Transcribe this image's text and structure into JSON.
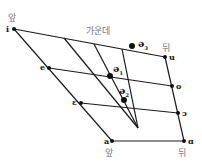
{
  "diagram": {
    "type": "vowel-quadrilateral",
    "labels": {
      "front_top": "앞",
      "back_top": "뒤",
      "central": "가운데",
      "front_bottom": "앞",
      "back_bottom": "뒤"
    },
    "vertices": {
      "i": {
        "label": "i",
        "x": 14,
        "y": 29
      },
      "e": {
        "label": "e",
        "x": 49,
        "y": 68
      },
      "epsilon": {
        "label": "ɛ",
        "x": 81,
        "y": 103
      },
      "a": {
        "label": "a",
        "x": 112,
        "y": 141
      },
      "u": {
        "label": "u",
        "x": 165,
        "y": 57
      },
      "o": {
        "label": "o",
        "x": 172,
        "y": 86
      },
      "open_o": {
        "label": "ɔ",
        "x": 178,
        "y": 113
      },
      "alpha": {
        "label": "ɑ",
        "x": 184,
        "y": 141
      }
    },
    "schwas": [
      {
        "label": "ə",
        "sub": "1",
        "x": 111,
        "y": 75
      },
      {
        "label": "ə",
        "sub": "2",
        "x": 124,
        "y": 99
      },
      {
        "label": "ə",
        "sub": "3",
        "x": 134,
        "y": 40
      }
    ],
    "line_color": "#1a1a1a"
  }
}
